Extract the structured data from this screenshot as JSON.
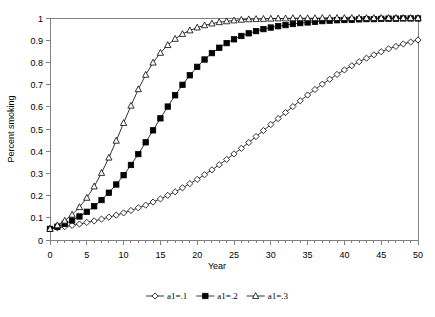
{
  "chart_data": {
    "type": "line",
    "title": "",
    "subtitle": "",
    "xlabel": "Year",
    "ylabel": "Percent smoking",
    "xlim": [
      0,
      50
    ],
    "ylim": [
      0,
      1
    ],
    "xticks": [
      0,
      5,
      10,
      15,
      20,
      25,
      30,
      35,
      40,
      45,
      50
    ],
    "xtick_labels": [
      "0",
      "5",
      "10",
      "15",
      "20",
      "25",
      "30",
      "35",
      "40",
      "45",
      "50"
    ],
    "xminor_step": 1,
    "yticks": [
      0,
      0.1,
      0.2,
      0.3,
      0.4,
      0.5,
      0.6,
      0.7,
      0.8,
      0.9,
      1
    ],
    "ytick_labels": [
      "0",
      "0.1",
      "0.2",
      "0.3",
      "0.4",
      "0.5",
      "0.6",
      "0.7",
      "0.8",
      "0.9",
      "1"
    ],
    "grid": false,
    "legend_position": "bottom",
    "x": [
      0,
      1,
      2,
      3,
      4,
      5,
      6,
      7,
      8,
      9,
      10,
      11,
      12,
      13,
      14,
      15,
      16,
      17,
      18,
      19,
      20,
      21,
      22,
      23,
      24,
      25,
      26,
      27,
      28,
      29,
      30,
      31,
      32,
      33,
      34,
      35,
      36,
      37,
      38,
      39,
      40,
      41,
      42,
      43,
      44,
      45,
      46,
      47,
      48,
      49,
      50
    ],
    "series": [
      {
        "name": "a1=.1",
        "marker": "open-diamond",
        "color": "#000000",
        "values": [
          0.05,
          0.055,
          0.06,
          0.066,
          0.072,
          0.079,
          0.086,
          0.094,
          0.103,
          0.112,
          0.122,
          0.133,
          0.145,
          0.157,
          0.171,
          0.185,
          0.201,
          0.217,
          0.235,
          0.254,
          0.273,
          0.294,
          0.316,
          0.339,
          0.363,
          0.388,
          0.413,
          0.439,
          0.466,
          0.493,
          0.52,
          0.547,
          0.574,
          0.601,
          0.627,
          0.653,
          0.678,
          0.702,
          0.724,
          0.746,
          0.766,
          0.785,
          0.803,
          0.819,
          0.834,
          0.848,
          0.861,
          0.872,
          0.883,
          0.892,
          0.901
        ]
      },
      {
        "name": "a1=.2",
        "marker": "filled-square",
        "color": "#000000",
        "values": [
          0.05,
          0.06,
          0.073,
          0.088,
          0.106,
          0.127,
          0.152,
          0.18,
          0.213,
          0.25,
          0.292,
          0.338,
          0.387,
          0.44,
          0.494,
          0.548,
          0.601,
          0.652,
          0.699,
          0.742,
          0.78,
          0.813,
          0.842,
          0.866,
          0.887,
          0.904,
          0.919,
          0.931,
          0.941,
          0.95,
          0.957,
          0.963,
          0.968,
          0.973,
          0.977,
          0.98,
          0.983,
          0.986,
          0.988,
          0.99,
          0.991,
          0.992,
          0.994,
          0.995,
          0.995,
          0.996,
          0.997,
          0.997,
          0.998,
          0.998,
          0.998
        ]
      },
      {
        "name": "a1=.3",
        "marker": "open-triangle",
        "color": "#000000",
        "values": [
          0.05,
          0.066,
          0.087,
          0.114,
          0.148,
          0.19,
          0.241,
          0.302,
          0.371,
          0.447,
          0.527,
          0.605,
          0.679,
          0.744,
          0.799,
          0.843,
          0.878,
          0.906,
          0.928,
          0.944,
          0.957,
          0.967,
          0.975,
          0.981,
          0.985,
          0.989,
          0.992,
          0.994,
          0.995,
          0.996,
          0.997,
          0.998,
          0.998,
          0.999,
          0.999,
          0.999,
          0.999,
          1.0,
          1.0,
          1.0,
          1.0,
          1.0,
          1.0,
          1.0,
          1.0,
          1.0,
          1.0,
          1.0,
          1.0,
          1.0,
          1.0
        ]
      }
    ],
    "legend": [
      {
        "label": "a1=.1",
        "marker": "open-diamond"
      },
      {
        "label": "a1=.2",
        "marker": "filled-square"
      },
      {
        "label": "a1=.3",
        "marker": "open-triangle"
      }
    ]
  }
}
